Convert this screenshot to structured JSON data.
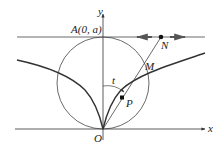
{
  "diagram": {
    "labels": {
      "y_axis": "y",
      "x_axis": "x",
      "origin": "O",
      "point_a": "A(0, a)",
      "point_n": "N",
      "point_m": "M",
      "point_p": "P",
      "angle": "t"
    },
    "colors": {
      "stroke": "#333333",
      "arrow": "#555555",
      "background": "#ffffff"
    }
  }
}
